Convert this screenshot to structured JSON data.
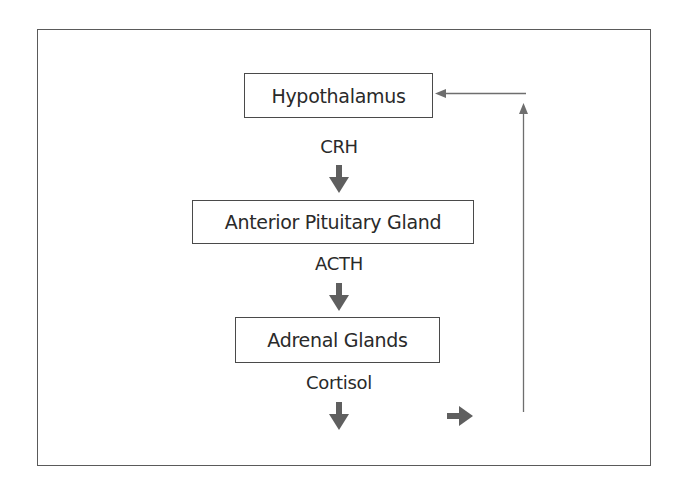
{
  "diagram": {
    "type": "flowchart",
    "title": "",
    "nodes": [
      {
        "id": "hypothalamus",
        "label": "Hypothalamus"
      },
      {
        "id": "anterior_pituitary",
        "label": "Anterior Pituitary Gland"
      },
      {
        "id": "adrenal",
        "label": "Adrenal Glands"
      }
    ],
    "edge_labels": {
      "crh": "CRH",
      "acth": "ACTH",
      "cortisol": "Cortisol"
    },
    "edges": [
      {
        "from": "hypothalamus",
        "to": "anterior_pituitary",
        "label": "CRH"
      },
      {
        "from": "anterior_pituitary",
        "to": "adrenal",
        "label": "ACTH"
      },
      {
        "from": "adrenal",
        "to": "(output)",
        "label": "Cortisol"
      },
      {
        "from": "(feedback)",
        "to": "hypothalamus",
        "label": ""
      }
    ],
    "colors": {
      "arrow_fill": "#5f5f5f",
      "line": "#6e6e6e",
      "border": "#4a4a4a"
    }
  }
}
